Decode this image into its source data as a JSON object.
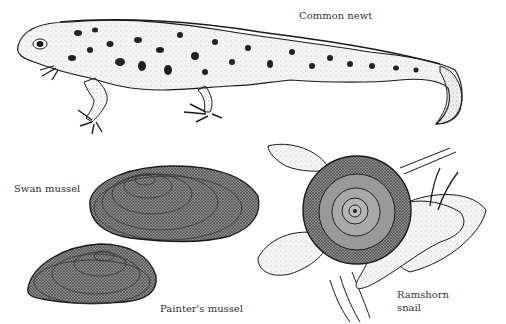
{
  "illustration": {
    "style": "black-and-white stippled natural history drawing",
    "background": "#ffffff",
    "ink_color": "#1a1a1a",
    "labels": {
      "common_newt": "Common newt",
      "swan_mussel": "Swan mussel",
      "painters_mussel": "Painter's mussel",
      "ramshorn_snail_line1": "Ramshorn",
      "ramshorn_snail_line2": "snail"
    },
    "subjects": [
      {
        "name": "Common newt",
        "position": "top, spanning full width"
      },
      {
        "name": "Swan mussel",
        "position": "center-left, large shell"
      },
      {
        "name": "Painter's mussel",
        "position": "bottom-left, smaller shell in front"
      },
      {
        "name": "Ramshorn snail",
        "position": "bottom-right, on aquatic leaves"
      }
    ]
  }
}
